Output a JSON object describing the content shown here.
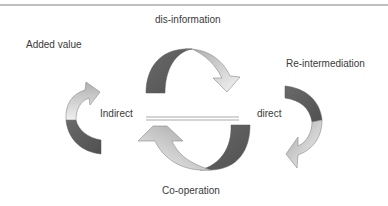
{
  "diagram": {
    "labels": {
      "top": "dis-information",
      "top_left": "Added value",
      "right": "Re-intermediation",
      "center_left": "Indirect",
      "center_right": "direct",
      "bottom": "Co-operation"
    },
    "colors": {
      "dark": "#5f5f5f",
      "light_start": "#9a9a9a",
      "light_end": "#f2f2f2",
      "outline": "#888888",
      "rule": "#bfbfbf"
    }
  }
}
